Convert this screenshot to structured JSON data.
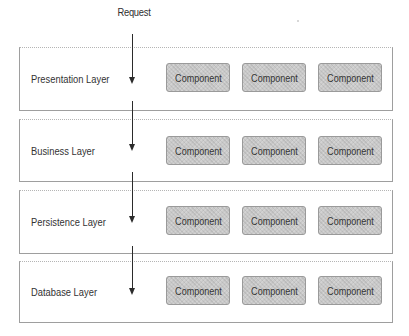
{
  "diagram": {
    "request_label": "Request",
    "layers": [
      {
        "label": "Presentation Layer",
        "components": [
          "Component",
          "Component",
          "Component"
        ]
      },
      {
        "label": "Business Layer",
        "components": [
          "Component",
          "Component",
          "Component"
        ]
      },
      {
        "label": "Persistence Layer",
        "components": [
          "Component",
          "Component",
          "Component"
        ]
      },
      {
        "label": "Database Layer",
        "components": [
          "Component",
          "Component",
          "Component"
        ]
      }
    ],
    "colors": {
      "component_fill": "#c9c9c9",
      "component_border": "#9a9a9a",
      "layer_border": "#9e9e9e",
      "arrow": "#2b2b2b",
      "text": "#333333"
    }
  }
}
